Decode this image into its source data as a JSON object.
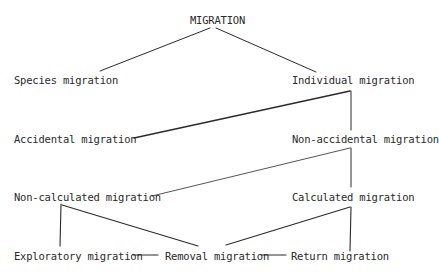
{
  "diagram": {
    "title": "MIGRATION",
    "nodes": {
      "root": "MIGRATION",
      "species": "Species migration",
      "individual": "Individual migration",
      "accidental": "Accidental migration",
      "non_accidental": "Non-accidental migration",
      "non_calculated": "Non-calculated migration",
      "calculated": "Calculated migration",
      "exploratory": "Exploratory migration",
      "removal": "Removal migration",
      "return": "Return migration"
    },
    "edges": [
      [
        "MIGRATION",
        "Species migration"
      ],
      [
        "MIGRATION",
        "Individual migration"
      ],
      [
        "Individual migration",
        "Accidental migration"
      ],
      [
        "Individual migration",
        "Non-accidental migration"
      ],
      [
        "Non-accidental migration",
        "Non-calculated migration"
      ],
      [
        "Non-accidental migration",
        "Calculated migration"
      ],
      [
        "Non-calculated migration",
        "Exploratory migration"
      ],
      [
        "Non-calculated migration",
        "Removal migration"
      ],
      [
        "Calculated migration",
        "Removal migration"
      ],
      [
        "Calculated migration",
        "Return migration"
      ],
      [
        "Exploratory migration",
        "Removal migration"
      ],
      [
        "Removal migration",
        "Return migration"
      ]
    ],
    "line_color": "#2a2a2a"
  }
}
